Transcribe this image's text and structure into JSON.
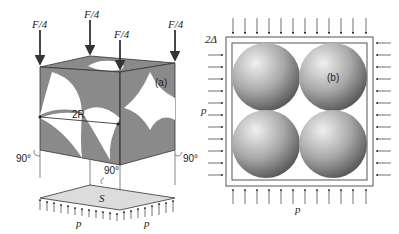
{
  "figure_a": {
    "panel_label": "(a)",
    "force_labels": [
      "F/4",
      "F/4",
      "F/4",
      "F/4"
    ],
    "diameter_label": "2R",
    "angle_labels": [
      "90°",
      "90°",
      "90°"
    ],
    "area_label": "S",
    "pressure_labels": [
      "p",
      "p"
    ]
  },
  "figure_b": {
    "panel_label": "(b)",
    "gap_label": "2Δ",
    "pressure_labels": [
      "p",
      "p"
    ]
  },
  "colors": {
    "cube_face": "#8a8a8a",
    "sphere_light": "#e6e6e6",
    "sphere_dark": "#5a5a5a",
    "plate": "#dcdcdc",
    "line": "#333333"
  }
}
